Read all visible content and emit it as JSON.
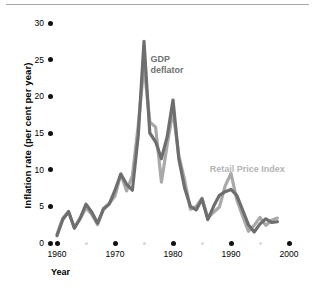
{
  "chart_data": {
    "type": "line",
    "title": "",
    "xlabel": "Year",
    "ylabel": "Inflation rate (per cent per year)",
    "xlim": [
      1960,
      2000
    ],
    "ylim": [
      0,
      30
    ],
    "grid": false,
    "legend_position": "inline-annotations",
    "xticks": [
      "1960",
      "1970",
      "1980",
      "1990",
      "2000"
    ],
    "xtick_values": [
      1960,
      1970,
      1980,
      1990,
      2000
    ],
    "xminor_values": [
      1965,
      1975,
      1985,
      1995
    ],
    "yticks": [
      "0",
      "5",
      "10",
      "15",
      "20",
      "25",
      "30"
    ],
    "ytick_values": [
      0,
      5,
      10,
      15,
      20,
      25,
      30
    ],
    "x": [
      1960,
      1961,
      1962,
      1963,
      1964,
      1965,
      1966,
      1967,
      1968,
      1969,
      1970,
      1971,
      1972,
      1973,
      1974,
      1975,
      1976,
      1977,
      1978,
      1979,
      1980,
      1981,
      1982,
      1983,
      1984,
      1985,
      1986,
      1987,
      1988,
      1989,
      1990,
      1991,
      1992,
      1993,
      1994,
      1995,
      1996,
      1997,
      1998
    ],
    "series": [
      {
        "name": "GDP deflator",
        "color": "#6e6e6e",
        "label_x": 1977,
        "label_y": 25,
        "values": [
          1.0,
          3.2,
          4.3,
          2.0,
          3.4,
          5.3,
          4.2,
          2.7,
          4.6,
          5.3,
          7.2,
          9.4,
          8.0,
          7.2,
          14.6,
          27.5,
          15.0,
          13.8,
          11.5,
          14.5,
          19.5,
          11.5,
          7.5,
          5.0,
          4.5,
          6.0,
          3.2,
          5.0,
          6.5,
          7.0,
          7.3,
          6.5,
          4.5,
          2.5,
          1.5,
          2.6,
          3.3,
          2.8,
          2.9
        ]
      },
      {
        "name": "Retail Price Index",
        "color": "#a9a9a9",
        "label_x": 1991,
        "label_y": 10,
        "values": [
          1.2,
          3.4,
          4.2,
          2.1,
          3.3,
          4.8,
          3.9,
          2.5,
          4.7,
          5.4,
          6.4,
          9.4,
          7.1,
          9.2,
          16.0,
          24.2,
          16.5,
          15.8,
          8.3,
          13.4,
          18.0,
          11.9,
          8.6,
          4.6,
          5.0,
          6.1,
          3.4,
          4.2,
          4.9,
          7.8,
          9.5,
          5.9,
          3.7,
          1.6,
          2.4,
          3.5,
          2.4,
          3.1,
          3.4
        ]
      }
    ]
  },
  "annotations": {
    "gdp_label_line1": "GDP",
    "gdp_label_line2": "deflator",
    "rpi_label": "Retail Price Index"
  },
  "axes": {
    "x_axis_title": "Year",
    "y_axis_title": "Inflation rate (per cent per year)"
  },
  "colors": {
    "gdp_line": "#6e6e6e",
    "rpi_line": "#a9a9a9",
    "tick_dot": "#111111",
    "minor_dot": "#d7d7d7",
    "rule": "#a8a8a8"
  }
}
